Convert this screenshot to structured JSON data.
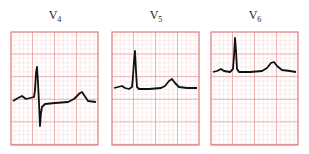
{
  "figure": {
    "grid_color_major": "#e07a7a",
    "grid_color_minor": "#f4c6c6",
    "trace_color": "#111111",
    "leads": [
      {
        "label": "V",
        "subscript": "4",
        "x": 10
      },
      {
        "label": "V",
        "subscript": "5",
        "x": 111
      },
      {
        "label": "V",
        "subscript": "6",
        "x": 210
      }
    ]
  }
}
